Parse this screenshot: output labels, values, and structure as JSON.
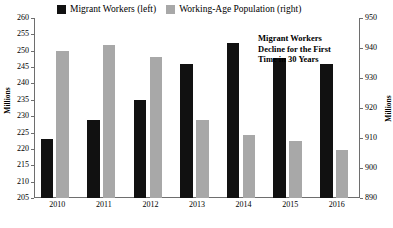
{
  "chart_data": {
    "type": "bar",
    "title": "",
    "categories": [
      "2010",
      "2011",
      "2012",
      "2013",
      "2014",
      "2015",
      "2016"
    ],
    "series": [
      {
        "name": "Migrant Workers (left)",
        "axis": "left",
        "color": "#111111",
        "values": [
          223.0,
          228.9,
          235.0,
          245.9,
          252.5,
          247.9,
          245.9
        ]
      },
      {
        "name": "Working-Age Population (right)",
        "axis": "right",
        "color": "#a8a8a8",
        "values": [
          939.0,
          941.0,
          937.0,
          916.0,
          911.0,
          909.0,
          906.0
        ]
      }
    ],
    "ylabel": "Millions",
    "ylabel_right": "Millions",
    "xlabel": "",
    "ylim": [
      205,
      260
    ],
    "ylim_right": [
      890,
      950
    ],
    "yticks": [
      205,
      210,
      215,
      220,
      225,
      230,
      235,
      240,
      245,
      250,
      255,
      260
    ],
    "yticks_right": [
      890,
      900,
      910,
      920,
      930,
      940,
      950
    ],
    "grid": false,
    "legend_position": "top",
    "annotations": [
      {
        "lines": [
          "Migrant Workers",
          "Decline for the First",
          "Time in 30 Years"
        ]
      }
    ]
  }
}
